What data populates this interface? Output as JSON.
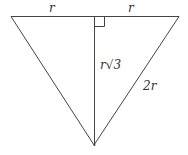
{
  "diagram": {
    "type": "equilateral-triangle-with-altitude",
    "labels": {
      "top_left_half": "r",
      "top_right_half": "r",
      "altitude": "r√3",
      "side": "2r"
    },
    "right_angle_marker": true,
    "line_color": "#444444"
  }
}
